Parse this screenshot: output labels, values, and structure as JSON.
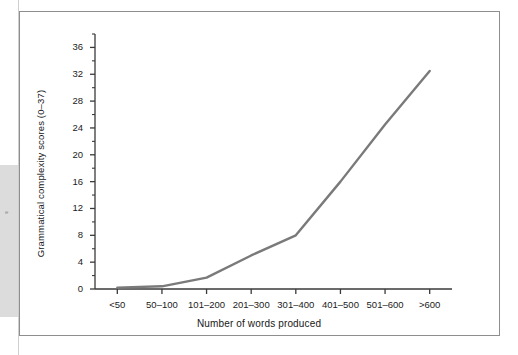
{
  "figure": {
    "frame_border_color": "#8e8e8e",
    "background_color": "#ffffff"
  },
  "artifacts": {
    "edge_mark": "e"
  },
  "chart_data": {
    "type": "line",
    "title": "",
    "subtitle": "",
    "xlabel": "Number of words produced",
    "ylabel": "Grammatical complexity scores (0–37)",
    "categories": [
      "<50",
      "50–100",
      "101–200",
      "201–300",
      "301–400",
      "401–500",
      "501–600",
      ">600"
    ],
    "values": [
      0.2,
      0.4,
      1.7,
      5.0,
      8.0,
      16.0,
      24.5,
      32.5
    ],
    "series": [
      {
        "name": "Grammatical complexity",
        "values": [
          0.2,
          0.4,
          1.7,
          5.0,
          8.0,
          16.0,
          24.5,
          32.5
        ],
        "color": "#7a7a7a"
      }
    ],
    "ylim": [
      0,
      38
    ],
    "yticks": [
      0,
      4,
      8,
      12,
      16,
      20,
      24,
      28,
      32,
      36
    ],
    "ytick_labels": [
      "0",
      "4",
      "8",
      "12",
      "16",
      "20",
      "24",
      "28",
      "32",
      "36"
    ],
    "xtick_labels": [
      "<50",
      "50–100",
      "101–200",
      "201–300",
      "301–400",
      "401–500",
      "501–600",
      ">600"
    ],
    "grid": false,
    "legend": false,
    "legend_position": "none",
    "line_color": "#7a7a7a",
    "line_width": 2.4,
    "axis_color": "#3a3a3a",
    "markers": false
  }
}
